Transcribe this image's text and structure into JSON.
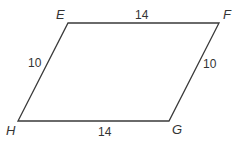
{
  "diagram": {
    "shape": "parallelogram",
    "stroke_color": "#3a3a3a",
    "vertices": [
      {
        "label": "E",
        "x": 68,
        "y": 23
      },
      {
        "label": "F",
        "x": 219,
        "y": 23
      },
      {
        "label": "G",
        "x": 169,
        "y": 121
      },
      {
        "label": "H",
        "x": 18,
        "y": 121
      }
    ],
    "vertex_labels": {
      "E": "E",
      "F": "F",
      "G": "G",
      "H": "H"
    },
    "side_labels": {
      "EF": "14",
      "FG": "10",
      "GH": "14",
      "HE": "10"
    }
  }
}
